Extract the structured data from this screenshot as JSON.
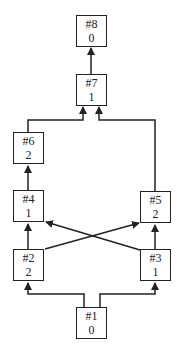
{
  "diagram": {
    "type": "directed-graph",
    "nodes": [
      {
        "id": "8",
        "label": "#8",
        "value": "0",
        "x": 76,
        "y": 15
      },
      {
        "id": "7",
        "label": "#7",
        "value": "1",
        "x": 76,
        "y": 74
      },
      {
        "id": "6",
        "label": "#6",
        "value": "2",
        "x": 13,
        "y": 132
      },
      {
        "id": "4",
        "label": "#4",
        "value": "1",
        "x": 13,
        "y": 190
      },
      {
        "id": "5",
        "label": "#5",
        "value": "2",
        "x": 140,
        "y": 191
      },
      {
        "id": "2",
        "label": "#2",
        "value": "2",
        "x": 13,
        "y": 249
      },
      {
        "id": "3",
        "label": "#3",
        "value": "1",
        "x": 140,
        "y": 249
      },
      {
        "id": "1",
        "label": "#1",
        "value": "0",
        "x": 76,
        "y": 307
      }
    ],
    "edges": [
      {
        "from": "1",
        "to": "2"
      },
      {
        "from": "1",
        "to": "3"
      },
      {
        "from": "2",
        "to": "4"
      },
      {
        "from": "2",
        "to": "5"
      },
      {
        "from": "3",
        "to": "5"
      },
      {
        "from": "3",
        "to": "4"
      },
      {
        "from": "4",
        "to": "6"
      },
      {
        "from": "6",
        "to": "7"
      },
      {
        "from": "5",
        "to": "7"
      },
      {
        "from": "7",
        "to": "8"
      }
    ]
  }
}
